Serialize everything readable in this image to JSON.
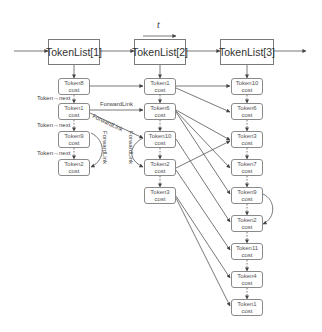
{
  "diagram": {
    "time_axis_label": "t",
    "token_lists": [
      {
        "label": "TokenList[1]"
      },
      {
        "label": "TokenList[2]"
      },
      {
        "label": "TokenList[3]"
      }
    ],
    "columns": [
      {
        "tokens": [
          {
            "name": "Token8",
            "sub": "cost"
          },
          {
            "name": "Token1",
            "sub": "cost"
          },
          {
            "name": "Token9",
            "sub": "cost"
          },
          {
            "name": "Token2",
            "sub": "cost"
          }
        ]
      },
      {
        "tokens": [
          {
            "name": "Token1",
            "sub": "cost"
          },
          {
            "name": "Token6",
            "sub": "cost"
          },
          {
            "name": "Token10",
            "sub": "cost"
          },
          {
            "name": "Token2",
            "sub": "cost"
          },
          {
            "name": "Token3",
            "sub": "cost"
          }
        ]
      },
      {
        "tokens": [
          {
            "name": "Token10",
            "sub": "cost"
          },
          {
            "name": "Token6",
            "sub": "cost"
          },
          {
            "name": "Token3",
            "sub": "cost"
          },
          {
            "name": "Token7",
            "sub": "cost"
          },
          {
            "name": "Token9",
            "sub": "cost"
          },
          {
            "name": "Token2",
            "sub": "cost"
          },
          {
            "name": "Token11",
            "sub": "cost"
          },
          {
            "name": "Token4",
            "sub": "cost"
          },
          {
            "name": "Token1",
            "sub": "cost"
          }
        ]
      }
    ],
    "labels": {
      "next1": "Token→next",
      "next2": "Token→next",
      "next3": "Token→next",
      "forward1": "ForwardLink",
      "forward2": "ForwardLink",
      "forward3": "ForwardLink",
      "forward4": "ForwardLink"
    },
    "colors": {
      "line": "#555555",
      "box_border": "#8a8a8a"
    }
  }
}
